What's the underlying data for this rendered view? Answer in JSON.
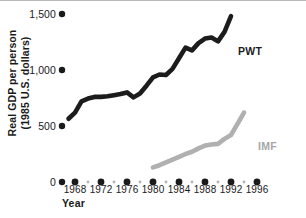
{
  "chart_data": {
    "type": "line",
    "title": "",
    "xlabel": "Year",
    "ylabel": "Real GDP per person\n(1985 U.S. dollars)",
    "ylabel_line1": "Real GDP per person",
    "ylabel_line2": "(1985 U.S. dollars)",
    "xlim": [
      1966,
      1996
    ],
    "ylim": [
      0,
      1500
    ],
    "grid": false,
    "legend_position": "inline-right",
    "ytick_labels": [
      "1,500",
      "1,000",
      "500",
      "0"
    ],
    "ytick_values": [
      1500,
      1000,
      500,
      0
    ],
    "xtick_labels": [
      "1968",
      "1972",
      "1976",
      "1980",
      "1984",
      "1988",
      "1992",
      "1996"
    ],
    "xtick_values": [
      1968,
      1972,
      1976,
      1980,
      1984,
      1988,
      1992,
      1996
    ],
    "xtick_minor_values": [
      1966,
      1970,
      1974,
      1978,
      1982,
      1986,
      1990,
      1994
    ],
    "series": [
      {
        "name": "PWT",
        "color": "#1c1c1c",
        "x": [
          1967,
          1968,
          1969,
          1970,
          1971,
          1972,
          1973,
          1974,
          1975,
          1976,
          1977,
          1978,
          1979,
          1980,
          1981,
          1982,
          1983,
          1984,
          1985,
          1986,
          1987,
          1988,
          1989,
          1990,
          1991,
          1992
        ],
        "values": [
          565,
          620,
          720,
          745,
          760,
          760,
          765,
          775,
          785,
          800,
          755,
          790,
          860,
          935,
          960,
          955,
          1010,
          1105,
          1200,
          1175,
          1240,
          1280,
          1290,
          1255,
          1340,
          1480
        ]
      },
      {
        "name": "IMF",
        "color": "#a6a6a6",
        "x": [
          1980,
          1981,
          1982,
          1983,
          1984,
          1985,
          1986,
          1987,
          1988,
          1989,
          1990,
          1991,
          1992,
          1993,
          1994
        ],
        "values": [
          130,
          150,
          175,
          200,
          225,
          250,
          270,
          300,
          325,
          335,
          340,
          385,
          420,
          520,
          620
        ]
      }
    ],
    "annotations": [
      {
        "text": "PWT",
        "x": 1989,
        "y": 1150,
        "color": "#1c1c1c"
      },
      {
        "text": "IMF",
        "x": 1992,
        "y": 330,
        "color": "#a6a6a6"
      }
    ]
  },
  "axis": {
    "tick_marker": "filled-dot",
    "origin_label": "0"
  }
}
